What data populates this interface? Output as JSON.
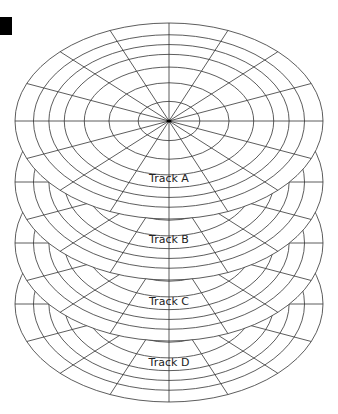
{
  "figure": {
    "type": "hard-disk-platters",
    "marker_color": "#000000",
    "line_color": "#333333",
    "background": "#ffffff",
    "center_x": 169,
    "rx": 154,
    "ry": 98,
    "ring_ratios": [
      0.2,
      0.39,
      0.55,
      0.68,
      0.78,
      0.88,
      1.0
    ],
    "spokes": 16,
    "platters": [
      {
        "name": "top",
        "cy": 121
      },
      {
        "name": "track-a-platter",
        "cy": 182
      },
      {
        "name": "track-b-platter",
        "cy": 243
      },
      {
        "name": "track-c-platter",
        "cy": 304
      }
    ],
    "labels": [
      {
        "text": "Track A",
        "x": 169,
        "y": 172
      },
      {
        "text": "Track B",
        "x": 169,
        "y": 233
      },
      {
        "text": "Track C",
        "x": 169,
        "y": 295
      },
      {
        "text": "Track D",
        "x": 169,
        "y": 356
      }
    ]
  }
}
